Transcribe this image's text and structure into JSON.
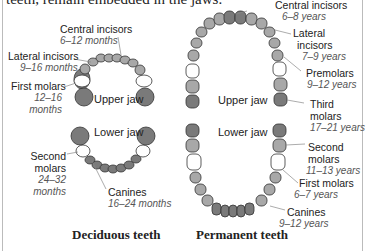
{
  "intro_text": "teeth, remain embedded in the jaws.",
  "deciduous": {
    "title": "Deciduous teeth",
    "upper_jaw": "Upper jaw",
    "lower_jaw": "Lower jaw",
    "labels": [
      {
        "name": "Central incisors",
        "age": "6–12 months"
      },
      {
        "name": "Lateral incisors",
        "age": "9–16 months"
      },
      {
        "name": "First molars",
        "age_line1": "12–16",
        "age_line2": "months"
      },
      {
        "name_line1": "Second",
        "name_line2": "molars",
        "age_line1": "24–32",
        "age_line2": "months"
      },
      {
        "name": "Canines",
        "age": "16–24 months"
      }
    ]
  },
  "permanent": {
    "title": "Permanent teeth",
    "upper_jaw": "Upper jaw",
    "lower_jaw": "Lower jaw",
    "labels": [
      {
        "name": "Central incisors",
        "age": "6–8 years"
      },
      {
        "name_line1": "Lateral",
        "name_line2": "incisors",
        "age": "7–9 years"
      },
      {
        "name": "Premolars",
        "age": "9–12 years"
      },
      {
        "name_line1": "Third",
        "name_line2": "molars",
        "age": "17–21 years"
      },
      {
        "name_line1": "Second",
        "name_line2": "molars",
        "age": "11–13 years"
      },
      {
        "name": "First molars",
        "age": "6–7 years"
      },
      {
        "name": "Canines",
        "age": "9–12 years"
      }
    ]
  },
  "colors": {
    "tooth_dark": "#7a7a7a",
    "tooth_mid": "#a8a8a8",
    "tooth_light": "#ffffff",
    "outline": "#333333",
    "border": "#bbbbbb"
  }
}
